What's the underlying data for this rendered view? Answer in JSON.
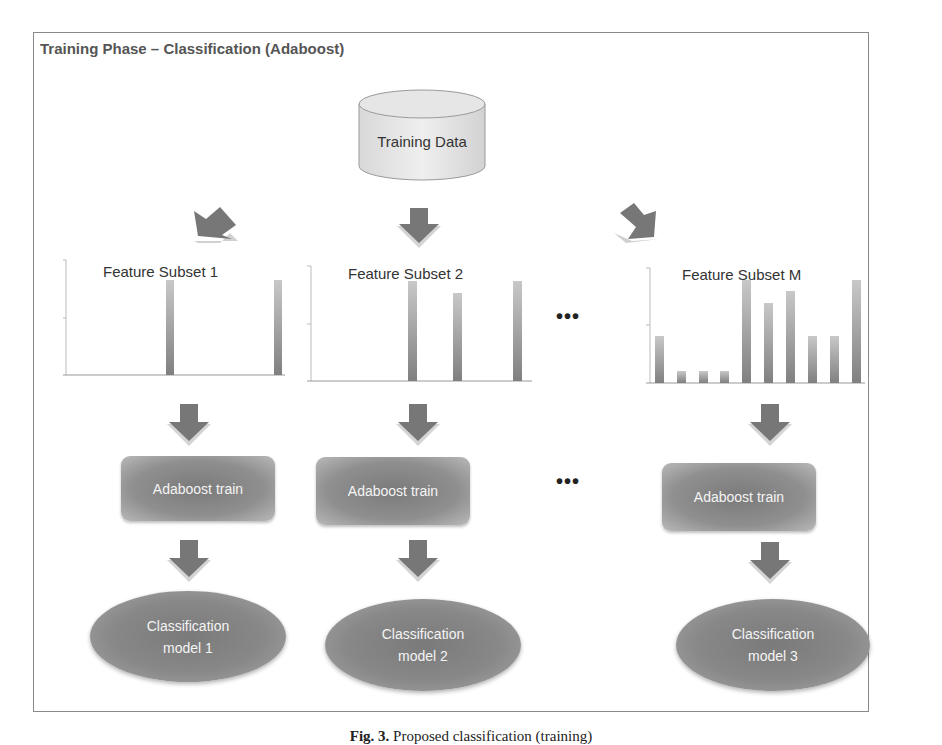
{
  "diagram": {
    "title": "Training Phase – Classification (Adaboost)",
    "source": {
      "label": "Training Data",
      "shape": "cylinder-icon"
    },
    "separator": "•••",
    "columns": [
      {
        "feature_subset": "Feature Subset 1",
        "bars": [
          0,
          0,
          0,
          0,
          1.0,
          0,
          0,
          0,
          0,
          1.0
        ],
        "bar_positions_px": [
          160,
          272
        ],
        "bar_heights_px": [
          95,
          95
        ],
        "train_label": "Adaboost train",
        "model_label_line1": "Classification",
        "model_label_line2": "model 1"
      },
      {
        "feature_subset": "Feature Subset 2",
        "bar_positions_px": [
          110,
          153,
          213
        ],
        "bar_heights_px": [
          100,
          90,
          100
        ],
        "train_label": "Adaboost train",
        "model_label_line1": "Classification",
        "model_label_line2": "model 2"
      },
      {
        "feature_subset": "Feature Subset M",
        "bar_positions_px": [
          15,
          37,
          59,
          80,
          102,
          124,
          146,
          168,
          190,
          212
        ],
        "bar_heights_px": [
          45,
          12,
          12,
          12,
          103,
          80,
          92,
          45,
          45,
          103
        ],
        "train_label": "Adaboost train",
        "model_label_line1": "Classification",
        "model_label_line2": "model 3"
      }
    ],
    "flow": [
      "Training Data",
      "Feature Subset",
      "Adaboost train",
      "Classification model"
    ],
    "colors": {
      "shape_fill": "#888888",
      "arrow_fill": "#7a7a7a",
      "frame": "#8a8a8a",
      "bar": "#8c8c8c"
    }
  },
  "caption": {
    "prefix": "Fig. 3.",
    "text": " Proposed classification (training)"
  }
}
